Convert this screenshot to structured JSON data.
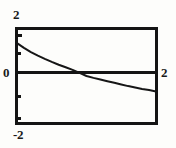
{
  "figure": {
    "title": "",
    "background_color": "#fdfdfb",
    "line_color": "#141414"
  },
  "labels": {
    "y_top": "2",
    "y_zero": "0",
    "y_bottom": "-2",
    "x_right": "2"
  },
  "chart_data": {
    "type": "line",
    "title": "",
    "xlabel": "",
    "ylabel": "",
    "xlim": [
      0,
      2
    ],
    "ylim": [
      -2,
      2
    ],
    "xticks": [
      0,
      2
    ],
    "xticklabels": [
      "",
      "2"
    ],
    "yticks": [
      -2,
      -1,
      0,
      1,
      2
    ],
    "yticklabels": [
      "-2",
      "",
      "0",
      "",
      "2"
    ],
    "grid": false,
    "legend": null,
    "axis_style": "box-frame-with-zero-line",
    "series": [
      {
        "name": "curve",
        "x": [
          0.0,
          0.1,
          0.2,
          0.3,
          0.4,
          0.5,
          0.6,
          0.7,
          0.8,
          0.9,
          1.0,
          1.1,
          1.2,
          1.3,
          1.4,
          1.5,
          1.6,
          1.7,
          1.8,
          1.9,
          2.0
        ],
        "y": [
          1.4,
          1.2,
          1.02,
          0.87,
          0.73,
          0.6,
          0.48,
          0.37,
          0.26,
          0.13,
          0.0,
          -0.08,
          -0.15,
          -0.22,
          -0.29,
          -0.36,
          -0.43,
          -0.49,
          -0.55,
          -0.6,
          -0.66
        ]
      }
    ]
  }
}
